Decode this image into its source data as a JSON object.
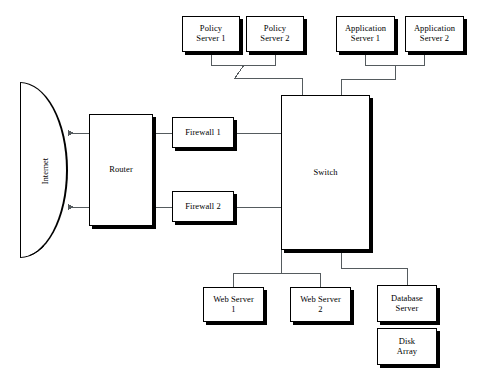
{
  "diagram": {
    "type": "network-topology",
    "colors": {
      "node_fill": "#ffffff",
      "node_border": "#000000",
      "node_shadow": "#000000",
      "wire": "#555b5e",
      "background": "#ffffff"
    },
    "cloud": {
      "name": "internet",
      "label": "Internet",
      "shape": "half-ellipse",
      "text_orientation": "vertical"
    },
    "nodes": [
      {
        "id": "policy-server-1",
        "label": "Policy\nServer 1"
      },
      {
        "id": "policy-server-2",
        "label": "Policy\nServer 2"
      },
      {
        "id": "application-server-1",
        "label": "Application\nServer 1"
      },
      {
        "id": "application-server-2",
        "label": "Application\nServer 2"
      },
      {
        "id": "router",
        "label": "Router"
      },
      {
        "id": "firewall-1",
        "label": "Firewall 1"
      },
      {
        "id": "firewall-2",
        "label": "Firewall 2"
      },
      {
        "id": "switch",
        "label": "Switch"
      },
      {
        "id": "web-server-1",
        "label": "Web Server\n1"
      },
      {
        "id": "web-server-2",
        "label": "Web Server\n2"
      },
      {
        "id": "database-server",
        "label": "Database\nServer"
      },
      {
        "id": "disk-array",
        "label": "Disk\nArray"
      }
    ],
    "links": [
      {
        "from": "router",
        "to": "internet",
        "arrow": "to-internet"
      },
      {
        "from": "router",
        "to": "internet",
        "arrow": "to-internet"
      },
      {
        "from": "router",
        "to": "firewall-1",
        "arrow": "none"
      },
      {
        "from": "router",
        "to": "firewall-2",
        "arrow": "none"
      },
      {
        "from": "firewall-1",
        "to": "switch",
        "arrow": "none"
      },
      {
        "from": "firewall-2",
        "to": "switch",
        "arrow": "none"
      },
      {
        "from": "policy-server-1",
        "to": "switch",
        "arrow": "none"
      },
      {
        "from": "policy-server-2",
        "to": "switch",
        "arrow": "none"
      },
      {
        "from": "application-server-1",
        "to": "switch",
        "arrow": "none"
      },
      {
        "from": "application-server-2",
        "to": "switch",
        "arrow": "none"
      },
      {
        "from": "switch",
        "to": "web-server-1",
        "arrow": "none"
      },
      {
        "from": "switch",
        "to": "web-server-2",
        "arrow": "none"
      },
      {
        "from": "switch",
        "to": "database-server",
        "arrow": "none"
      },
      {
        "from": "database-server",
        "to": "disk-array",
        "arrow": "none"
      }
    ]
  }
}
